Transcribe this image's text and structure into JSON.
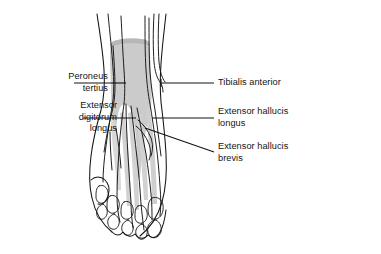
{
  "figure": {
    "background_color": "#ffffff",
    "ink_color": "#141414",
    "shade_color": "#c9c9c9",
    "shade_color_light": "#dedede",
    "shade_color_dark": "#b4b4b4"
  },
  "labels": {
    "peroneus_tertius": {
      "line1": "Peroneus",
      "line2": "tertius",
      "side": "left"
    },
    "extensor_digitorum_longus": {
      "line1": "Extensor",
      "line2": "digitorum",
      "line3": "longus",
      "side": "left"
    },
    "tibialis_anterior": {
      "line1": "Tibialis anterior",
      "side": "right"
    },
    "extensor_hallucis_longus": {
      "line1": "Extensor hallucis",
      "line2": "longus",
      "side": "right"
    },
    "extensor_hallucis_brevis": {
      "line1": "Extensor hallucis",
      "line2": "brevis",
      "side": "right"
    }
  },
  "leader_lines": {
    "peroneus_tertius": "horizontal leader from label to lateral tendon",
    "extensor_digitorum_longus": "horizontal leader from label to muscle belly",
    "tibialis_anterior": "horizontal leader with hook to medial tendon",
    "extensor_hallucis_longus": "horizontal leader from tendon to label",
    "extensor_hallucis_brevis": "diagonal leader from muscle belly down to label"
  }
}
